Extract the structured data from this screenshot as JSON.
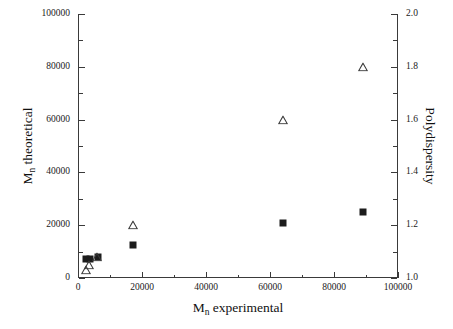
{
  "chart_data": {
    "type": "scatter",
    "title": "",
    "xlabel": "M_n experimental",
    "ylabel": "M_n theoretical",
    "y2label": "Polydispersity",
    "xlim": [
      0,
      100000
    ],
    "ylim": [
      0,
      100000
    ],
    "y2lim": [
      1.0,
      2.0
    ],
    "grid": false,
    "legend": "none",
    "x_ticks": [
      0,
      20000,
      40000,
      60000,
      80000,
      100000
    ],
    "x_ticklabels": [
      "0",
      "20000",
      "40000",
      "60000",
      "80000",
      "100000"
    ],
    "x_minor_ticks": [
      10000,
      30000,
      50000,
      70000,
      90000
    ],
    "y_ticks": [
      0,
      20000,
      40000,
      60000,
      80000,
      100000
    ],
    "y_ticklabels": [
      "0",
      "20000",
      "40000",
      "60000",
      "80000",
      "100000"
    ],
    "y_minor_ticks": [
      10000,
      30000,
      50000,
      70000,
      90000
    ],
    "y2_ticks": [
      1.0,
      1.2,
      1.4,
      1.6,
      1.8,
      2.0
    ],
    "y2_ticklabels": [
      "1.0",
      "1.2",
      "1.4",
      "1.6",
      "1.8",
      "2.0"
    ],
    "y2_minor_ticks": [
      1.1,
      1.3,
      1.5,
      1.7,
      1.9
    ],
    "series": [
      {
        "name": "M_n theoretical",
        "marker": "filled-square",
        "color": "#1c1c1c",
        "axis": "left",
        "points": [
          {
            "x": 2600,
            "y": 7200
          },
          {
            "x": 3600,
            "y": 7300
          },
          {
            "x": 6200,
            "y": 8000
          },
          {
            "x": 17200,
            "y": 12400
          },
          {
            "x": 64200,
            "y": 21000
          },
          {
            "x": 89200,
            "y": 25000
          }
        ]
      },
      {
        "name": "Polydispersity",
        "marker": "open-triangle",
        "color": "#3a3a3a",
        "axis": "right",
        "points": [
          {
            "x": 2500,
            "y": 1.03
          },
          {
            "x": 3500,
            "y": 1.05
          },
          {
            "x": 6000,
            "y": 1.08
          },
          {
            "x": 17200,
            "y": 1.2
          },
          {
            "x": 64200,
            "y": 1.6
          },
          {
            "x": 89200,
            "y": 1.8
          }
        ]
      }
    ]
  },
  "axis_titles": {
    "x_main": "M",
    "x_sub": "n",
    "x_rest": " experimental",
    "y_main": "M",
    "y_sub": "n",
    "y_rest": " theoretical",
    "y2": "Polydispersity"
  }
}
